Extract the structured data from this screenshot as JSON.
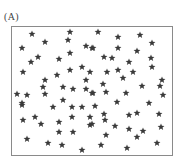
{
  "figure": {
    "label": "(A)",
    "frame": {
      "x": 11,
      "y": 26,
      "width": 162,
      "height": 130
    },
    "marker": {
      "shape": "five-point-star",
      "color": "#3a3a3a",
      "size": 6
    },
    "points": [
      [
        32,
        34
      ],
      [
        70,
        32
      ],
      [
        68,
        40
      ],
      [
        45,
        42
      ],
      [
        22,
        48
      ],
      [
        86,
        46
      ],
      [
        92,
        48
      ],
      [
        70,
        53
      ],
      [
        38,
        57
      ],
      [
        31,
        62
      ],
      [
        59,
        59
      ],
      [
        98,
        32
      ],
      [
        118,
        37
      ],
      [
        140,
        35
      ],
      [
        93,
        48
      ],
      [
        118,
        48
      ],
      [
        152,
        43
      ],
      [
        137,
        51
      ],
      [
        104,
        57
      ],
      [
        112,
        58
      ],
      [
        129,
        62
      ],
      [
        151,
        58
      ],
      [
        152,
        67
      ],
      [
        23,
        72
      ],
      [
        57,
        75
      ],
      [
        70,
        70
      ],
      [
        82,
        67
      ],
      [
        90,
        72
      ],
      [
        45,
        80
      ],
      [
        86,
        80
      ],
      [
        43,
        87
      ],
      [
        63,
        87
      ],
      [
        73,
        89
      ],
      [
        86,
        89
      ],
      [
        92,
        93
      ],
      [
        17,
        94
      ],
      [
        27,
        95
      ],
      [
        45,
        94
      ],
      [
        63,
        100
      ],
      [
        22,
        103
      ],
      [
        107,
        72
      ],
      [
        118,
        70
      ],
      [
        133,
        72
      ],
      [
        123,
        78
      ],
      [
        103,
        84
      ],
      [
        142,
        86
      ],
      [
        162,
        80
      ],
      [
        160,
        86
      ],
      [
        93,
        93
      ],
      [
        106,
        92
      ],
      [
        126,
        93
      ],
      [
        163,
        95
      ],
      [
        117,
        102
      ],
      [
        149,
        103
      ],
      [
        22,
        105
      ],
      [
        53,
        107
      ],
      [
        72,
        107
      ],
      [
        82,
        107
      ],
      [
        95,
        106
      ],
      [
        23,
        120
      ],
      [
        35,
        117
      ],
      [
        41,
        124
      ],
      [
        59,
        122
      ],
      [
        72,
        117
      ],
      [
        90,
        117
      ],
      [
        90,
        125
      ],
      [
        59,
        132
      ],
      [
        73,
        132
      ],
      [
        27,
        139
      ],
      [
        48,
        143
      ],
      [
        62,
        145
      ],
      [
        82,
        150
      ],
      [
        104,
        114
      ],
      [
        105,
        120
      ],
      [
        129,
        115
      ],
      [
        137,
        113
      ],
      [
        159,
        114
      ],
      [
        92,
        124
      ],
      [
        115,
        126
      ],
      [
        129,
        129
      ],
      [
        143,
        131
      ],
      [
        161,
        127
      ],
      [
        106,
        135
      ],
      [
        137,
        137
      ],
      [
        101,
        145
      ],
      [
        127,
        148
      ],
      [
        157,
        143
      ]
    ]
  }
}
